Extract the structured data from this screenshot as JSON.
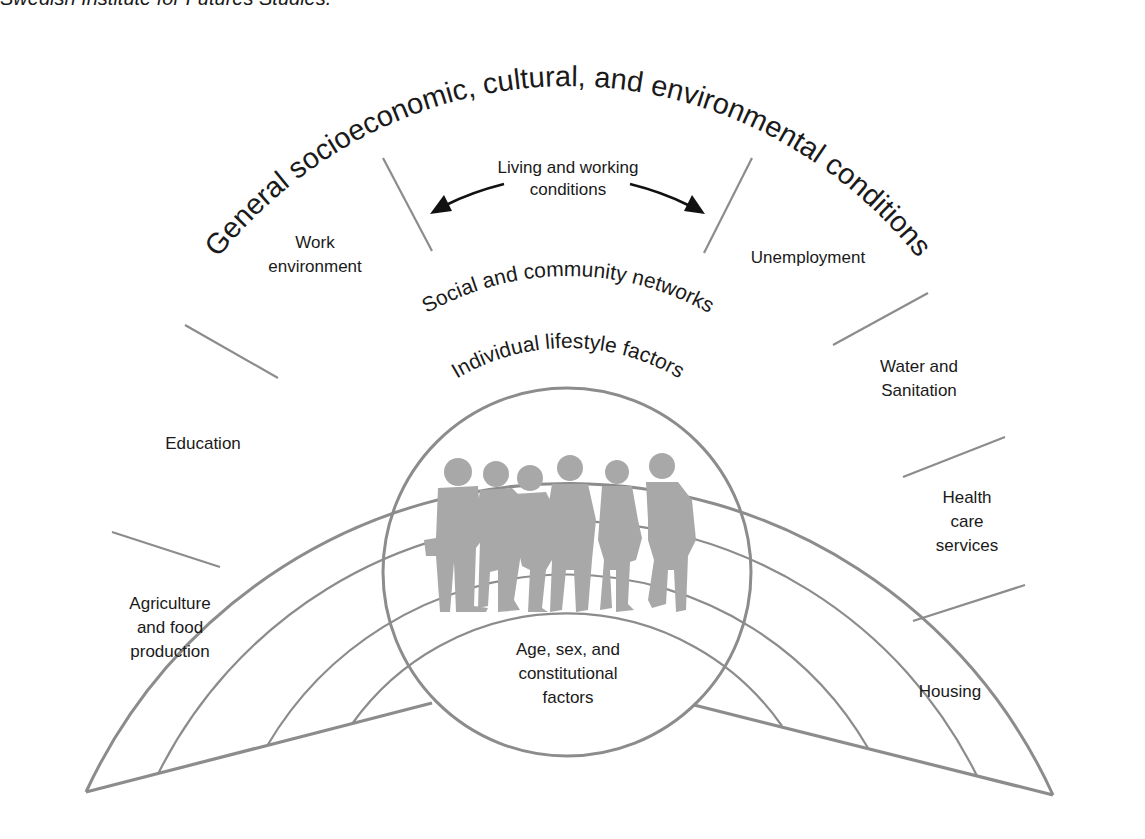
{
  "source_caption": "Swedish Institute for Futures Studies.",
  "diagram": {
    "layers": {
      "outer": "General socioeconomic, cultural, and environmental conditions",
      "social": "Social and community networks",
      "individual": "Individual lifestyle factors",
      "core": [
        "Age, sex, and",
        "constitutional",
        "factors"
      ]
    },
    "living_working_conditions": {
      "label_line1": "Living and working",
      "label_line2": "conditions",
      "segments": [
        {
          "id": "agriculture",
          "lines": [
            "Agriculture",
            "and food",
            "production"
          ]
        },
        {
          "id": "education",
          "lines": [
            "Education"
          ]
        },
        {
          "id": "work-environment",
          "lines": [
            "Work",
            "environment"
          ]
        },
        {
          "id": "unemployment",
          "lines": [
            "Unemployment"
          ]
        },
        {
          "id": "water-sanitation",
          "lines": [
            "Water and",
            "Sanitation"
          ]
        },
        {
          "id": "health-care",
          "lines": [
            "Health",
            "care",
            "services"
          ]
        },
        {
          "id": "housing",
          "lines": [
            "Housing"
          ]
        }
      ]
    },
    "icons": {
      "center_image": "group-of-people-silhouette-icon",
      "arrows": "double-curved-arrow-icon"
    },
    "colors": {
      "stroke": "#8c8c8c",
      "text": "#1a1a1a",
      "silhouette": "#a8a8a8",
      "background": "#ffffff"
    }
  }
}
